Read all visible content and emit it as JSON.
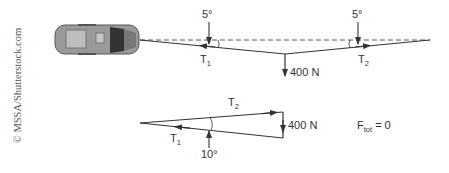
{
  "credit": "© MSSA/Shutterstock.com",
  "top_diagram": {
    "angle_left": "5°",
    "angle_right": "5°",
    "tension_left": {
      "base": "T",
      "sub": "1"
    },
    "tension_right": {
      "base": "T",
      "sub": "2"
    },
    "weight": "400 N"
  },
  "bottom_diagram": {
    "tension_top": {
      "base": "T",
      "sub": "2"
    },
    "tension_bottom": {
      "base": "T",
      "sub": "1"
    },
    "weight": "400 N",
    "angle": "10°",
    "equation": {
      "base": "F",
      "sub": "tot",
      "rest": " = 0"
    }
  }
}
